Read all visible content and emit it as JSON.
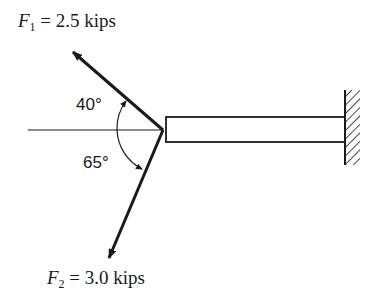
{
  "diagram": {
    "forces": [
      {
        "symbol": "F",
        "subscript": "1",
        "value": "= 2.5 kips",
        "angle_label": "40°"
      },
      {
        "symbol": "F",
        "subscript": "2",
        "value": "= 3.0 kips",
        "angle_label": "65°"
      }
    ],
    "colors": {
      "ink": "#1a1a1a",
      "background": "#ffffff"
    }
  }
}
